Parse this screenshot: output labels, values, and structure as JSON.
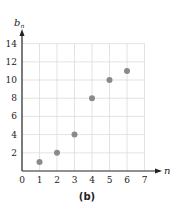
{
  "chart_data": {
    "type": "scatter",
    "title": "",
    "caption": "(b)",
    "xlabel": "n",
    "ylabel": "b",
    "ylabel_subscript": "n",
    "xlim": [
      0,
      7
    ],
    "ylim": [
      0,
      14
    ],
    "x_ticks": [
      0,
      1,
      2,
      3,
      4,
      5,
      6,
      7
    ],
    "y_ticks": [
      2,
      4,
      6,
      8,
      10,
      12,
      14
    ],
    "grid": true,
    "legend": null,
    "series": [
      {
        "name": "b_n",
        "color": "#8a8a8a",
        "points": [
          {
            "x": 1,
            "y": 1
          },
          {
            "x": 2,
            "y": 2
          },
          {
            "x": 3,
            "y": 4
          },
          {
            "x": 4,
            "y": 8
          },
          {
            "x": 5,
            "y": 10
          },
          {
            "x": 6,
            "y": 11
          }
        ]
      }
    ]
  },
  "colors": {
    "grid": "#dcdcdc",
    "axis": "#222222",
    "points": "#8a8a8a"
  }
}
